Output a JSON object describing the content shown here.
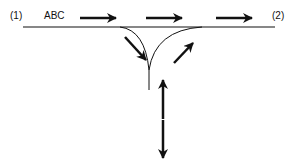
{
  "labels": {
    "start": "(1)",
    "name": "ABC",
    "end": "(2)"
  },
  "colors": {
    "stroke": "#111111",
    "background": "#ffffff"
  }
}
